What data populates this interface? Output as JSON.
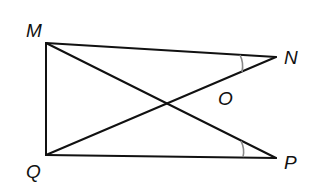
{
  "diagram": {
    "type": "geometry",
    "points": {
      "M": {
        "label": "M",
        "x": 46,
        "y": 43
      },
      "N": {
        "label": "N",
        "x": 276,
        "y": 57
      },
      "P": {
        "label": "P",
        "x": 276,
        "y": 158
      },
      "Q": {
        "label": "Q",
        "x": 46,
        "y": 155
      },
      "O": {
        "label": "O",
        "x": 181,
        "y": 98
      }
    },
    "segments": [
      "MN",
      "MQ",
      "QP",
      "MP",
      "NQ"
    ],
    "angle_marks": [
      {
        "vertex": "N",
        "between": [
          "M",
          "Q"
        ],
        "arcs": 1
      },
      {
        "vertex": "P",
        "between": [
          "M",
          "Q"
        ],
        "arcs": 1
      }
    ],
    "colors": {
      "line": "#111111",
      "angle_mark": "#888888",
      "background": "#ffffff"
    }
  }
}
